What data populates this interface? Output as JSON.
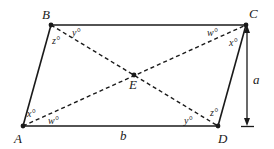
{
  "diagram": {
    "type": "parallelogram-with-diagonals",
    "vertices": {
      "A": {
        "label": "A",
        "x": 23,
        "y": 126
      },
      "B": {
        "label": "B",
        "x": 51,
        "y": 25
      },
      "C": {
        "label": "C",
        "x": 246,
        "y": 25
      },
      "D": {
        "label": "D",
        "x": 218,
        "y": 126
      },
      "E": {
        "label": "E",
        "x": 134,
        "y": 75
      }
    },
    "angles": {
      "B_z": "z°",
      "B_y": "y°",
      "C_w": "w°",
      "C_x": "x°",
      "A_x": "x°",
      "A_w": "w°",
      "D_y": "y°",
      "D_z": "z°"
    },
    "segments": {
      "base": "b",
      "height": "a"
    },
    "colors": {
      "stroke": "#1a1a1a",
      "background": "#ffffff"
    }
  }
}
